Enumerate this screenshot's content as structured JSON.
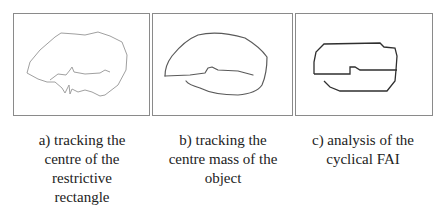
{
  "figure": {
    "panels": [
      {
        "id": "a",
        "caption_lines": [
          "a) tracking the",
          "centre of the",
          "restrictive",
          "rectangle"
        ],
        "trajectory_color": "#9a9a9a",
        "trajectory_style": "thin irregular jagged closed path"
      },
      {
        "id": "b",
        "caption_lines": [
          "b) tracking the",
          "centre mass of the",
          "object"
        ],
        "trajectory_color": "#555555",
        "trajectory_style": "smooth rounded path"
      },
      {
        "id": "c",
        "caption_lines": [
          "c) analysis of the",
          "cyclical FAI"
        ],
        "trajectory_color": "#333333",
        "trajectory_style": "angular rectilinear path"
      }
    ],
    "panel_border_color": "#8a8a8a"
  }
}
